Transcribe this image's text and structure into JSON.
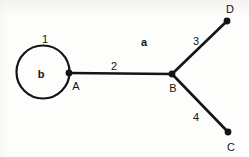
{
  "figure": {
    "kind": "graph-diagram",
    "caption": "",
    "background_color": "#fdfdfc",
    "ink_color": "#141414",
    "width": 249,
    "height": 157
  },
  "bleed_through": {
    "text": "",
    "note": "faint scanned ghost text along top edge"
  },
  "vertices": [
    {
      "id": "A",
      "label": "A",
      "x": 69,
      "y": 73,
      "label_x": 76,
      "label_y": 86,
      "dot_r": 3.4
    },
    {
      "id": "B",
      "label": "B",
      "x": 172,
      "y": 74,
      "label_x": 173,
      "label_y": 88,
      "dot_r": 3.4
    },
    {
      "id": "C",
      "label": "C",
      "x": 228,
      "y": 132,
      "label_x": 231,
      "label_y": 147,
      "dot_r": 3.4
    },
    {
      "id": "D",
      "label": "D",
      "x": 227,
      "y": 21,
      "label_x": 230,
      "label_y": 9,
      "dot_r": 3.4
    }
  ],
  "edges": [
    {
      "id": "e1",
      "label": "1",
      "type": "self-loop",
      "from": "A",
      "to": "A",
      "circle_cx": 43,
      "circle_cy": 72,
      "circle_r": 26.5,
      "stroke_width": 2.2,
      "label_x": 45,
      "label_y": 39
    },
    {
      "id": "e2",
      "label": "2",
      "type": "straight",
      "from": "A",
      "to": "B",
      "x1": 69,
      "y1": 73,
      "x2": 172,
      "y2": 74,
      "stroke_width": 2.6,
      "label_x": 114,
      "label_y": 66
    },
    {
      "id": "e3",
      "label": "3",
      "type": "straight",
      "from": "B",
      "to": "D",
      "x1": 172,
      "y1": 74,
      "x2": 227,
      "y2": 21,
      "stroke_width": 2.6,
      "label_x": 196,
      "label_y": 41
    },
    {
      "id": "e4",
      "label": "4",
      "type": "straight",
      "from": "B",
      "to": "C",
      "x1": 172,
      "y1": 74,
      "x2": 228,
      "y2": 132,
      "stroke_width": 2.6,
      "label_x": 196,
      "label_y": 117
    }
  ],
  "faces": [
    {
      "id": "b",
      "label": "b",
      "description": "interior face of self-loop",
      "x": 41,
      "y": 74
    },
    {
      "id": "a",
      "label": "a",
      "description": "outer face",
      "x": 144,
      "y": 42
    }
  ]
}
